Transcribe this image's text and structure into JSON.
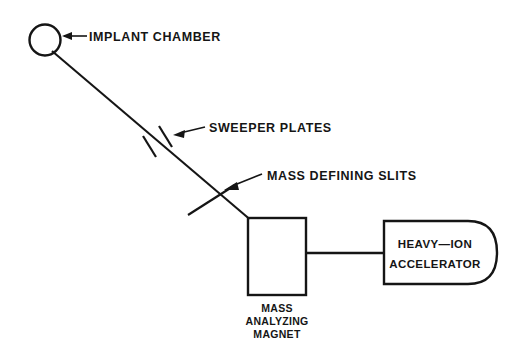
{
  "figure": {
    "type": "schematic-diagram",
    "background_color": "#ffffff",
    "ink_color": "#151515"
  },
  "components": {
    "implant_chamber": {
      "label": "IMPLANT CHAMBER",
      "shape": "circle"
    },
    "sweeper_plates": {
      "label": "SWEEPER PLATES",
      "shape": "two-parallel-plates"
    },
    "mass_defining_slits": {
      "label": "MASS DEFINING SLITS",
      "shape": "slit-line"
    },
    "mass_analyzing_magnet": {
      "caption_line1": "MASS",
      "caption_line2": "ANALYZING",
      "caption_line3": "MAGNET",
      "shape": "rectangle"
    },
    "heavy_ion_accelerator": {
      "label_line1": "HEAVY—ION",
      "label_line2": "ACCELERATOR",
      "shape": "rounded-end-rectangle"
    }
  },
  "connectors": {
    "beam_line_name": "ion-beam-line",
    "accelerator_link_name": "magnet-accelerator-link"
  }
}
